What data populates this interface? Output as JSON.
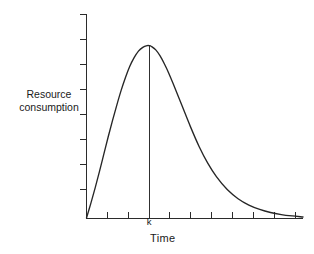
{
  "figure": {
    "background_color": "#ffffff",
    "line_color": "#262626",
    "axis_color": "#2b2b2b",
    "text_color": "#1a1a1a"
  },
  "labels": {
    "ylabel_line1": "Resource",
    "ylabel_line2": "consumption",
    "xlabel": "Time",
    "peak_marker": "k"
  },
  "chart_data": {
    "type": "line",
    "title": "",
    "subtitle": "",
    "xlabel": "Time",
    "ylabel": "Resource consumption",
    "grid": false,
    "legend": false,
    "legend_position": "none",
    "axis_tick_labels_shown": false,
    "xlim": [
      0,
      10
    ],
    "ylim": [
      0,
      1.18
    ],
    "x_tick_count": 9,
    "y_tick_count": 8,
    "x_tick_values": [
      1,
      2,
      3,
      4,
      5,
      6,
      7,
      8,
      9
    ],
    "y_tick_values": [
      0.1,
      0.25,
      0.4,
      0.55,
      0.7,
      0.85,
      1.0,
      1.12
    ],
    "annotations": [
      {
        "text": "k",
        "x": 2.9,
        "y": 0,
        "description": "peak location marked on x-axis with vertical drop line to curve maximum"
      }
    ],
    "series": [
      {
        "name": "Resource consumption",
        "color": "#262626",
        "x": [
          0.0,
          0.2,
          0.4,
          0.6,
          0.8,
          1.0,
          1.2,
          1.4,
          1.6,
          1.8,
          2.0,
          2.2,
          2.4,
          2.6,
          2.8,
          2.9,
          3.0,
          3.2,
          3.4,
          3.6,
          3.8,
          4.0,
          4.4,
          4.8,
          5.2,
          5.6,
          6.0,
          6.5,
          7.0,
          7.5,
          8.0,
          8.5,
          9.0,
          9.5,
          10.0
        ],
        "y": [
          0.0,
          0.085,
          0.175,
          0.27,
          0.37,
          0.47,
          0.565,
          0.655,
          0.74,
          0.815,
          0.88,
          0.93,
          0.968,
          0.99,
          1.0,
          1.0,
          0.995,
          0.975,
          0.94,
          0.893,
          0.84,
          0.78,
          0.655,
          0.53,
          0.415,
          0.318,
          0.24,
          0.165,
          0.112,
          0.075,
          0.05,
          0.032,
          0.02,
          0.012,
          0.006
        ]
      }
    ]
  }
}
